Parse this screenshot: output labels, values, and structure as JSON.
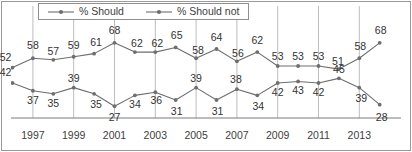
{
  "chart_data": {
    "type": "line",
    "title": "",
    "subtitle": "",
    "xlabel": "",
    "ylabel": "",
    "grid": "vertical-only",
    "legend_position": "top-left",
    "x": [
      1996,
      1997,
      1998,
      1999,
      2000,
      2001,
      2002,
      2003,
      2004,
      2005,
      2006,
      2007,
      2008,
      2009,
      2010,
      2011,
      2012,
      2013,
      2014
    ],
    "tick_labels": [
      "1997",
      "1999",
      "2001",
      "2003",
      "2005",
      "2007",
      "2009",
      "2011",
      "2013",
      "2015"
    ],
    "ylim": [
      20,
      75
    ],
    "series": [
      {
        "name": "% Should",
        "color": "#6e6e6e",
        "values": [
          52,
          58,
          57,
          59,
          61,
          68,
          62,
          62,
          65,
          58,
          64,
          56,
          62,
          53,
          53,
          53,
          51,
          58,
          68
        ]
      },
      {
        "name": "% Should not",
        "color": "#6e6e6e",
        "values": [
          42,
          37,
          35,
          39,
          35,
          27,
          34,
          36,
          31,
          39,
          31,
          38,
          34,
          42,
          43,
          42,
          45,
          39,
          28
        ]
      }
    ]
  },
  "legend": {
    "items": [
      {
        "label": "% Should",
        "marker": "line-dot-marker"
      },
      {
        "label": "% Should not",
        "marker": "line-dot-marker"
      }
    ]
  },
  "colors": {
    "series_line": "#6e6e6e",
    "gridline": "#b5b5b5",
    "axis": "#7a7a7a",
    "border": "#9a9a9a",
    "label_text": "#333333",
    "background": "#ffffff"
  }
}
